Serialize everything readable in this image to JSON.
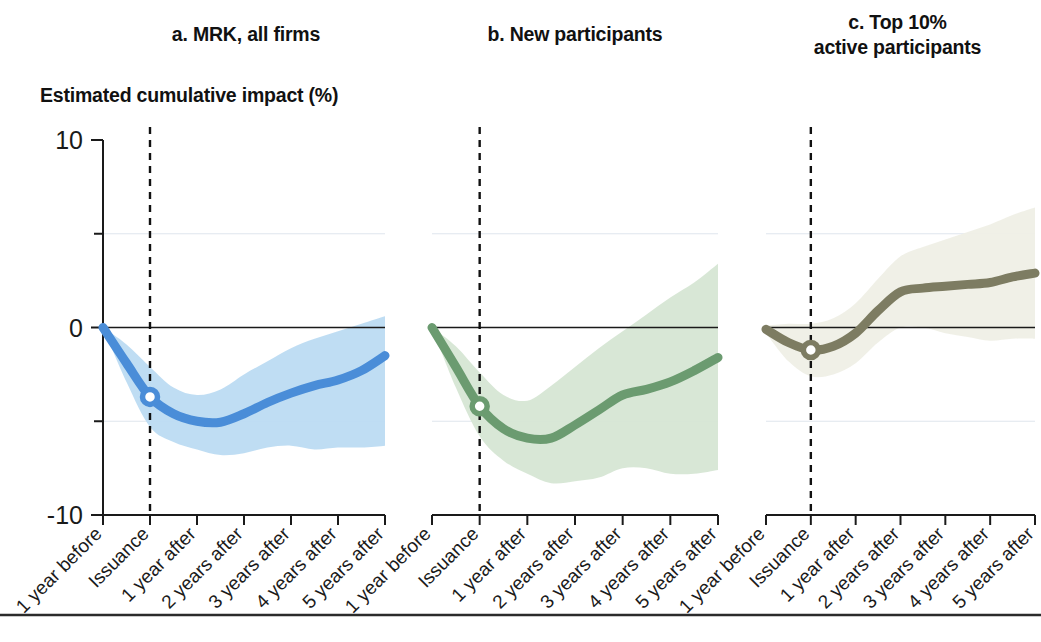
{
  "figure": {
    "axis_subtitle": "Estimated cumulative impact (%)",
    "bottom_rule": true
  },
  "panels": [
    {
      "id": "a",
      "title": "a. MRK, all firms",
      "color": "#4A8DD8",
      "band_color": "#BCDBF2",
      "band_opacity": 0.95
    },
    {
      "id": "b",
      "title": "b. New participants",
      "color": "#6B9B70",
      "band_color": "#D6E6D4",
      "band_opacity": 0.95
    },
    {
      "id": "c",
      "title": "c. Top 10%\nactive participants",
      "color": "#7D7C62",
      "band_color": "#EFEFE6",
      "band_opacity": 0.95
    }
  ],
  "axes": {
    "y_label_values": [
      "10",
      "0",
      "-10"
    ],
    "y_major_ticks": [
      10,
      0,
      -10
    ],
    "y_minor_ticks": [
      5,
      -5
    ],
    "ylim": [
      -10,
      10
    ],
    "gridlines_at": [
      5,
      -5
    ],
    "zero_line_at": 0,
    "x_tick_labels": [
      "1 year before",
      "Issuance",
      "1 year after",
      "2 years after",
      "3 years after",
      "4 years after",
      "5 years after"
    ],
    "x_values": [
      -1,
      0,
      1,
      2,
      3,
      4,
      5
    ],
    "xlim": [
      -1,
      5
    ],
    "event_marker_at_x": 0,
    "x_tick_label_rotation_deg": -45
  },
  "chart_data": {
    "type": "line",
    "title": "Estimated cumulative impact (%)",
    "xlabel": "",
    "ylabel": "Estimated cumulative impact (%)",
    "ylim": [
      -10,
      10
    ],
    "xlim": [
      -1,
      5
    ],
    "grid": true,
    "legend": "none",
    "annotations": [
      "Vertical dashed line marks issuance (x = 0)",
      "Open circle marker on each series at issuance"
    ],
    "panels": [
      {
        "id": "a",
        "title": "a. MRK, all firms",
        "color": "#4A8DD8",
        "x": [
          -1,
          -0.5,
          0,
          0.5,
          1,
          1.5,
          2,
          2.5,
          3,
          3.5,
          4,
          4.5,
          5
        ],
        "estimate": [
          0.0,
          -1.9,
          -3.7,
          -4.6,
          -5.0,
          -5.05,
          -4.6,
          -4.0,
          -3.5,
          -3.1,
          -2.8,
          -2.3,
          -1.5
        ],
        "ci_upper": [
          0.0,
          -0.9,
          -2.1,
          -3.2,
          -3.6,
          -3.3,
          -2.5,
          -1.8,
          -1.1,
          -0.6,
          -0.2,
          0.2,
          0.6
        ],
        "ci_lower": [
          0.0,
          -2.9,
          -5.3,
          -6.1,
          -6.5,
          -6.8,
          -6.7,
          -6.4,
          -6.3,
          -6.5,
          -6.4,
          -6.4,
          -6.3
        ],
        "marker_at_issuance": -3.7
      },
      {
        "id": "b",
        "title": "b. New participants",
        "color": "#6B9B70",
        "x": [
          -1,
          -0.5,
          0,
          0.5,
          1,
          1.5,
          2,
          2.5,
          3,
          3.5,
          4,
          4.5,
          5
        ],
        "estimate": [
          0.0,
          -2.1,
          -4.2,
          -5.4,
          -5.9,
          -5.9,
          -5.2,
          -4.4,
          -3.6,
          -3.3,
          -2.9,
          -2.3,
          -1.6
        ],
        "ci_upper": [
          0.0,
          -1.0,
          -2.4,
          -3.6,
          -3.9,
          -3.1,
          -2.1,
          -1.1,
          -0.2,
          0.7,
          1.6,
          2.4,
          3.4
        ],
        "ci_lower": [
          0.0,
          -3.2,
          -5.8,
          -7.1,
          -7.8,
          -8.3,
          -8.2,
          -8.0,
          -7.5,
          -7.5,
          -7.8,
          -7.8,
          -7.6
        ],
        "marker_at_issuance": -4.2
      },
      {
        "id": "c",
        "title": "c. Top 10% active participants",
        "color": "#7D7C62",
        "x": [
          -1,
          -0.5,
          0,
          0.5,
          1,
          1.5,
          2,
          2.5,
          3,
          3.5,
          4,
          4.5,
          5
        ],
        "estimate": [
          -0.1,
          -0.8,
          -1.2,
          -1.0,
          -0.3,
          0.9,
          1.9,
          2.1,
          2.2,
          2.3,
          2.4,
          2.7,
          2.9
        ],
        "ci_upper": [
          0.1,
          0.2,
          0.2,
          0.5,
          1.3,
          2.6,
          3.8,
          4.3,
          4.7,
          5.1,
          5.5,
          6.0,
          6.4
        ],
        "ci_lower": [
          -0.3,
          -1.8,
          -2.6,
          -2.5,
          -1.9,
          -0.8,
          0.0,
          0.0,
          -0.3,
          -0.5,
          -0.7,
          -0.6,
          -0.6
        ],
        "marker_at_issuance": -1.2
      }
    ]
  }
}
